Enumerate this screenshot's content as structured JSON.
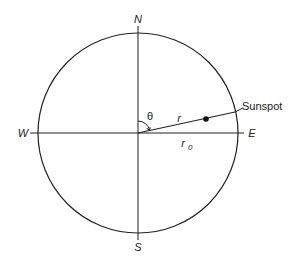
{
  "diagram": {
    "labels": {
      "north": "N",
      "south": "S",
      "west": "W",
      "east": "E",
      "theta": "θ",
      "r": "r",
      "r0_base": "r",
      "r0_sub": "0",
      "sunspot": "Sunspot"
    },
    "geometry": {
      "center": [
        138,
        133
      ],
      "radius": 100,
      "sunspot_point": [
        206,
        120
      ],
      "radius_line_end": [
        235,
        113
      ]
    },
    "colors": {
      "stroke": "#222222",
      "background": "#ffffff"
    }
  }
}
